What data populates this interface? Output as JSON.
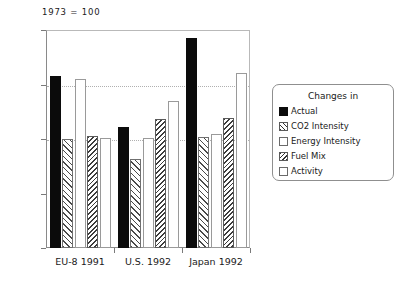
{
  "figure": {
    "note": "1973 = 100"
  },
  "chart_data": {
    "type": "bar",
    "title": "",
    "subtitle": "1973 = 100",
    "xlabel": "",
    "ylabel": "",
    "ylim": [
      0,
      200
    ],
    "yticks": [
      0,
      50,
      100,
      150,
      200
    ],
    "ytick_labels": [
      "0",
      "50",
      "100",
      "150",
      "200"
    ],
    "gridlines": [
      100,
      150
    ],
    "grid": true,
    "legend_position": "right",
    "legend_title": "Changes in",
    "categories": [
      "EU-8 1991",
      "U.S. 1992",
      "Japan 1992"
    ],
    "series": [
      {
        "name": "Actual",
        "pattern": "solid",
        "values": [
          158,
          111,
          193
        ]
      },
      {
        "name": "CO2 Intensity",
        "pattern": "hatch-fwd",
        "values": [
          100,
          82,
          102
        ]
      },
      {
        "name": "Energy Intensity",
        "pattern": "open",
        "values": [
          155,
          101,
          105
        ]
      },
      {
        "name": "Fuel Mix",
        "pattern": "hatch-back",
        "values": [
          103,
          118,
          119
        ]
      },
      {
        "name": "Activity",
        "pattern": "open",
        "values": [
          101,
          135,
          161
        ]
      }
    ]
  },
  "legend": {
    "title": "Changes in",
    "items": [
      {
        "label": "Actual",
        "pattern": "solid"
      },
      {
        "label": "CO2 Intensity",
        "pattern": "hatch-fwd"
      },
      {
        "label": "Energy Intensity",
        "pattern": "open"
      },
      {
        "label": "Fuel Mix",
        "pattern": "hatch-back"
      },
      {
        "label": "Activity",
        "pattern": "open"
      }
    ]
  }
}
